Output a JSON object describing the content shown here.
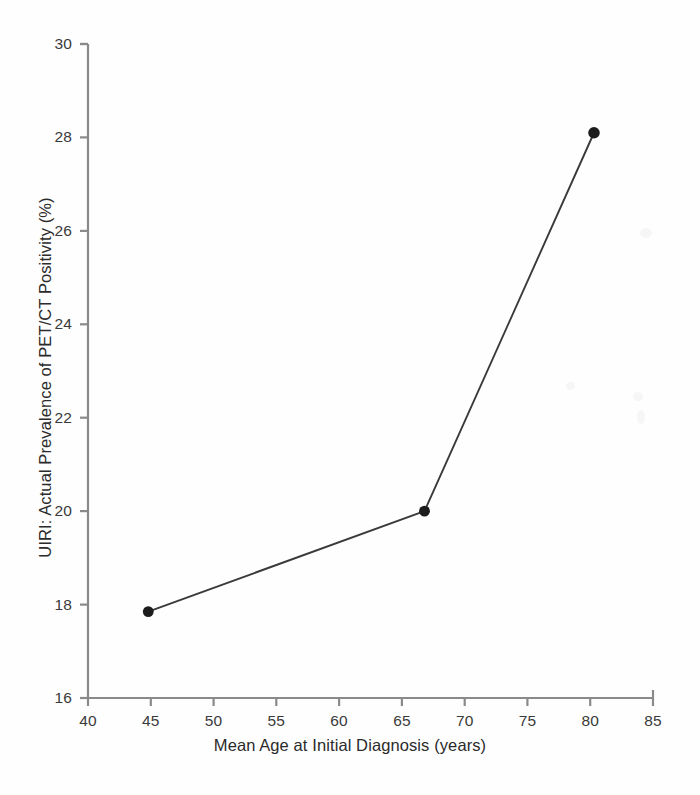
{
  "chart_data": {
    "type": "line",
    "title": "",
    "xlabel": "Mean Age at Initial Diagnosis (years)",
    "ylabel": "UIRI: Actual Prevalence of PET/CT Positivity (%)",
    "xlim": [
      40,
      85
    ],
    "ylim": [
      16,
      30
    ],
    "xticks": [
      40,
      45,
      50,
      55,
      60,
      65,
      70,
      75,
      80,
      85
    ],
    "xtick_labels": [
      "40",
      "45",
      "50",
      "55",
      "60",
      "65",
      "70",
      "75",
      "80",
      "85"
    ],
    "yticks": [
      16,
      18,
      20,
      22,
      24,
      26,
      28,
      30
    ],
    "ytick_labels": [
      "16",
      "18",
      "20",
      "22",
      "24",
      "26",
      "28",
      "30"
    ],
    "grid": false,
    "legend": "none",
    "marker": "filled-circle",
    "marker_color": "#1c1c1c",
    "line_color": "#3a3a3a",
    "axis_color": "#8a8a8a",
    "background_color": "#fefefe",
    "x": [
      44.8,
      66.8,
      80.3
    ],
    "y": [
      17.85,
      20.0,
      28.1
    ],
    "points": [
      {
        "x": 44.8,
        "y": 17.85
      },
      {
        "x": 66.8,
        "y": 20.0
      },
      {
        "x": 80.3,
        "y": 28.1
      }
    ],
    "series": [
      {
        "name": "UIRI: Actual Prevalence of PET/CT Positivity",
        "x": [
          44.8,
          66.8,
          80.3
        ],
        "values": [
          17.85,
          20.0,
          28.1
        ]
      }
    ]
  }
}
